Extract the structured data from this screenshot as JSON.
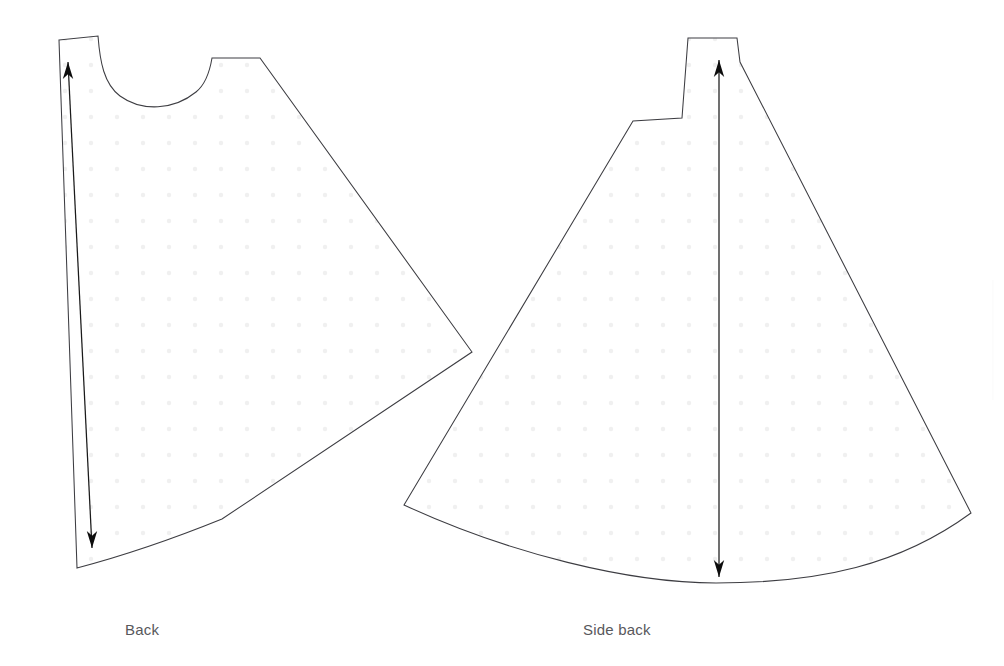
{
  "document": {
    "type": "sewing-pattern-diagram",
    "background_color": "#ffffff",
    "width": 1004,
    "height": 666
  },
  "style": {
    "outline_color": "#3d3d42",
    "outline_width": 1.05,
    "dot_color": "#f0f0f0",
    "dot_spacing": 26,
    "dot_radius": 2.2,
    "grainline_color": "#1a1a1a",
    "label_color": "#58585c",
    "label_font_size": "15px"
  },
  "pieces": [
    {
      "id": "back",
      "label": "Back",
      "label_position": {
        "x": 125,
        "y": 621
      },
      "outline_path": "M 59 40 L 98 36 C 100 62 104 84 120 96 C 142 112 174 110 196 92 C 206 84 210 70 212 58 L 260 58 L 472 352 L 222 519 C 180 536 130 554 77 568 L 59 40 Z",
      "grainline": {
        "x1": 68,
        "y1": 62,
        "x2": 92,
        "y2": 548,
        "head_top": true,
        "head_bottom": true
      }
    },
    {
      "id": "side-back",
      "label": "Side back",
      "label_position": {
        "x": 583,
        "y": 621
      },
      "outline_path": "M 688 38 L 737 38 L 740 62 L 971 513 C 900 565 820 583 716 583 C 630 583 510 554 404 505 L 633 121 L 682 118 L 688 38 Z",
      "grainline": {
        "x1": 719,
        "y1": 60,
        "x2": 719,
        "y2": 577,
        "head_top": true,
        "head_bottom": true
      }
    }
  ],
  "edge_marks": [
    {
      "id": "right-edge-sliver",
      "description": "faint vertical line at right page edge",
      "x": 993,
      "y_top": 280,
      "y_bottom": 400
    }
  ]
}
